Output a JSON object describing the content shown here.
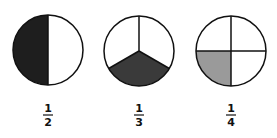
{
  "figure": {
    "colors": {
      "outline": "#111111",
      "background": "#ffffff"
    },
    "items": [
      {
        "numerator": "1",
        "denominator": "2",
        "parts": 2,
        "shaded": 1,
        "shade_color": "#1e1e1e"
      },
      {
        "numerator": "1",
        "denominator": "3",
        "parts": 3,
        "shaded": 1,
        "shade_color": "#3a3a3a"
      },
      {
        "numerator": "1",
        "denominator": "4",
        "parts": 4,
        "shaded": 1,
        "shade_color": "#9a9a9a"
      }
    ]
  }
}
